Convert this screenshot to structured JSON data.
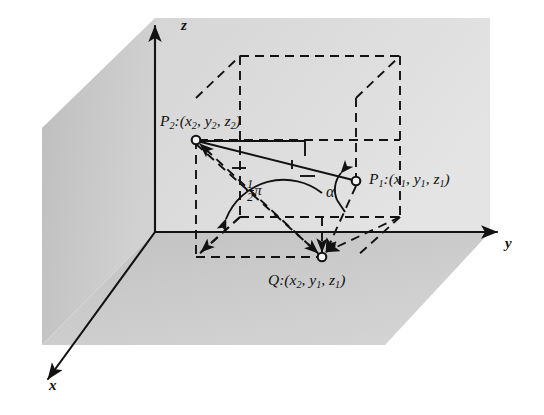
{
  "figure": {
    "background_color": "#ffffff",
    "ink_color": "#121212",
    "planes": {
      "left_wall_color": "#c7c7c7",
      "right_wall_color": "#dedede",
      "floor_color": "#cfcfcf"
    }
  },
  "axes": [
    {
      "name": "z",
      "label": "z",
      "direction": "up"
    },
    {
      "name": "y",
      "label": "y",
      "direction": "right"
    },
    {
      "name": "x",
      "label": "x",
      "direction": "down-left"
    }
  ],
  "points": [
    {
      "id": "P2",
      "name": "P2",
      "label_main": "P",
      "label_sub": "2",
      "label_full": "P2:(x2, y2, z2)",
      "coords": [
        "x2",
        "y2",
        "z2"
      ]
    },
    {
      "id": "P1",
      "name": "P1",
      "label_main": "P",
      "label_sub": "1",
      "label_full": "P1:(x1, y1, z1)",
      "coords": [
        "x1",
        "y1",
        "z1"
      ]
    },
    {
      "id": "Q",
      "name": "Q",
      "label_main": "Q",
      "label_sub": "",
      "label_full": "Q:(x2, y1, z1)",
      "coords": [
        "x2",
        "y1",
        "z1"
      ]
    }
  ],
  "labels": {
    "z_axis": "z",
    "y_axis": "y",
    "x_axis": "x",
    "p2_prefix": "P",
    "p2_index": "2",
    "p2_open": ":(",
    "p2_x": "x",
    "p2_x_sub": "2",
    "p2_comma1": ", ",
    "p2_y": "y",
    "p2_y_sub": "2",
    "p2_comma2": ", ",
    "p2_z": "z",
    "p2_z_sub": "2",
    "p2_close": ")",
    "p1_prefix": "P",
    "p1_index": "1",
    "p1_open": ":(",
    "p1_x": "x",
    "p1_x_sub": "1",
    "p1_comma1": ", ",
    "p1_y": "y",
    "p1_y_sub": "1",
    "p1_comma2": ", ",
    "p1_z": "z",
    "p1_z_sub": "1",
    "p1_close": ")",
    "q_prefix": "Q",
    "q_open": ":(",
    "q_x": "x",
    "q_x_sub": "2",
    "q_comma1": ", ",
    "q_y": "y",
    "q_y_sub": "1",
    "q_comma2": ", ",
    "q_z": "z",
    "q_z_sub": "1",
    "q_close": ")"
  },
  "angles": [
    {
      "id": "half-pi",
      "name": "right-angle-at-origin",
      "numerator": "1",
      "denominator": "2",
      "symbol": "π",
      "text": "1/2 pi"
    },
    {
      "id": "alpha",
      "name": "angle-alpha-at-P1",
      "symbol": "α",
      "text": "alpha"
    }
  ],
  "geometry": {
    "origin": {
      "x": 155,
      "y": 232
    },
    "z_axis_top": {
      "x": 155,
      "y": 18
    },
    "y_axis_end": {
      "x": 505,
      "y": 232
    },
    "x_axis_end": {
      "x": 42,
      "y": 385
    },
    "P2": {
      "x": 196,
      "y": 140
    },
    "P1": {
      "x": 356,
      "y": 181
    },
    "Q": {
      "x": 322,
      "y": 257
    },
    "box_front_bottom_left": {
      "x": 196,
      "y": 257
    },
    "box_back_bottom_left": {
      "x": 240,
      "y": 217
    },
    "box_back_bottom_right": {
      "x": 400,
      "y": 217
    },
    "box_top_back_left": {
      "x": 240,
      "y": 56
    },
    "box_top_back_right": {
      "x": 400,
      "y": 56
    },
    "box_top_front_right": {
      "x": 356,
      "y": 98
    },
    "box_top_front_left": {
      "x": 196,
      "y": 98
    }
  }
}
